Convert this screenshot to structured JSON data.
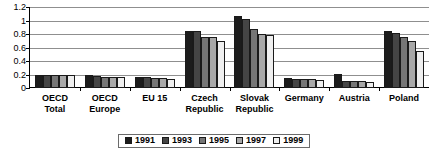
{
  "chart_data": {
    "type": "bar",
    "title": "",
    "xlabel": "",
    "ylabel": "",
    "ylim": [
      0,
      1.2
    ],
    "ytick_labels": [
      "1.2",
      "1",
      "0.8",
      "0.6",
      "0.4",
      "0.2",
      "0"
    ],
    "ytick_values": [
      1.2,
      1.0,
      0.8,
      0.6,
      0.4,
      0.2,
      0
    ],
    "grid": true,
    "legend_position": "bottom-center",
    "categories": [
      "OECD Total",
      "OECD Europe",
      "EU 15",
      "Czech Republic",
      "Slovak Republic",
      "Germany",
      "Austria",
      "Poland"
    ],
    "category_lines": [
      [
        "OECD",
        "Total"
      ],
      [
        "OECD",
        "Europe"
      ],
      [
        "EU 15",
        ""
      ],
      [
        "Czech",
        "Republic"
      ],
      [
        "Slovak",
        "Republic"
      ],
      [
        "Germany",
        ""
      ],
      [
        "Austria",
        ""
      ],
      [
        "Poland",
        ""
      ]
    ],
    "series": [
      {
        "name": "1991",
        "color": "#1c1c1c",
        "values": [
          0.2,
          0.19,
          0.17,
          0.85,
          1.07,
          0.15,
          0.21,
          0.85
        ]
      },
      {
        "name": "1993",
        "color": "#454545",
        "values": [
          0.19,
          0.18,
          0.16,
          0.85,
          1.02,
          0.14,
          0.11,
          0.82
        ]
      },
      {
        "name": "1995",
        "color": "#767676",
        "values": [
          0.19,
          0.17,
          0.15,
          0.76,
          0.88,
          0.13,
          0.1,
          0.75
        ]
      },
      {
        "name": "1997",
        "color": "#a8a8a8",
        "values": [
          0.19,
          0.17,
          0.15,
          0.75,
          0.8,
          0.13,
          0.1,
          0.7
        ]
      },
      {
        "name": "1999",
        "color": "#efefef",
        "values": [
          0.19,
          0.17,
          0.13,
          0.7,
          0.78,
          0.12,
          0.09,
          0.55
        ]
      }
    ]
  },
  "legend": {
    "items": [
      {
        "label": "1991"
      },
      {
        "label": "1993"
      },
      {
        "label": "1995"
      },
      {
        "label": "1997"
      },
      {
        "label": "1999"
      }
    ]
  }
}
